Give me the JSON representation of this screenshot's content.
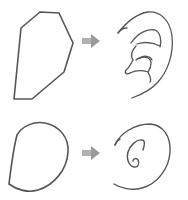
{
  "diagram": {
    "title": "",
    "rows": [
      {
        "source_shape": "polygon-outline",
        "arrow": "right-arrow",
        "target_shape": "ear-drawing"
      },
      {
        "source_shape": "d-shape-oval-outline",
        "arrow": "right-arrow",
        "target_shape": "spiral-ear-drawing"
      }
    ],
    "colors": {
      "stroke": "#555555",
      "arrow": "#a8a8a8",
      "background": "#ffffff"
    }
  }
}
